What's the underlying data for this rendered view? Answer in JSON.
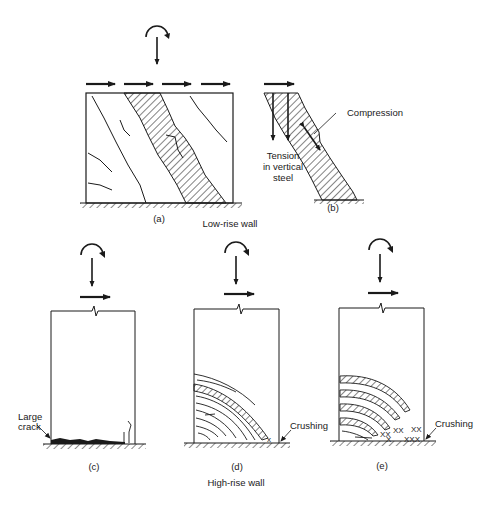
{
  "figure": {
    "sections": {
      "low_rise": {
        "caption": "Low-rise wall",
        "panels": {
          "a": {
            "label": "(a)"
          },
          "b": {
            "label": "(b)",
            "annotations": {
              "compression": "Compression",
              "tension_line1": "Tension",
              "tension_line2": "in vertical",
              "tension_line3": "steel"
            }
          }
        }
      },
      "high_rise": {
        "caption": "High-rise wall",
        "panels": {
          "c": {
            "label": "(c)",
            "annotations": {
              "crack_line1": "Large",
              "crack_line2": "crack"
            }
          },
          "d": {
            "label": "(d)",
            "annotations": {
              "crushing": "Crushing"
            }
          },
          "e": {
            "label": "(e)",
            "annotations": {
              "crushing": "Crushing"
            }
          }
        }
      }
    },
    "colors": {
      "ink": "#1a1a1a",
      "background": "#ffffff"
    }
  }
}
